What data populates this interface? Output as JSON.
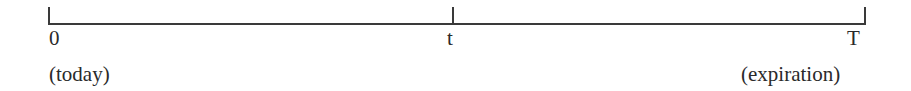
{
  "timeline": {
    "points": [
      {
        "label": "0",
        "sublabel": "(today)"
      },
      {
        "label": "t",
        "sublabel": ""
      },
      {
        "label": "T",
        "sublabel": "(expiration)"
      }
    ],
    "line_color": "#3a3a3a",
    "text_color": "#2a2a2a"
  }
}
